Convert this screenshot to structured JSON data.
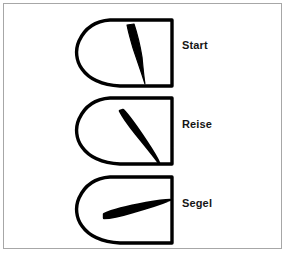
{
  "figure": {
    "background_color": "#ffffff",
    "frame_color": "#a7a7a7",
    "outline_color": "#000000",
    "fill_color": "#000000",
    "label_color": "#151515"
  },
  "diagram": {
    "type": "technical-line-drawing",
    "rows": [
      {
        "id": "start",
        "label": "Start",
        "icon": "wing-planform-icon",
        "inner_shape": "narrow-vertical-sliver",
        "inner_shape_name": "shaded-slot-start"
      },
      {
        "id": "reise",
        "label": "Reise",
        "icon": "wing-planform-icon",
        "inner_shape": "diagonal-blade",
        "inner_shape_name": "shaded-slot-reise"
      },
      {
        "id": "segel",
        "label": "Segel",
        "icon": "wing-planform-icon",
        "inner_shape": "horizontal-blade",
        "inner_shape_name": "shaded-slot-segel"
      }
    ]
  }
}
